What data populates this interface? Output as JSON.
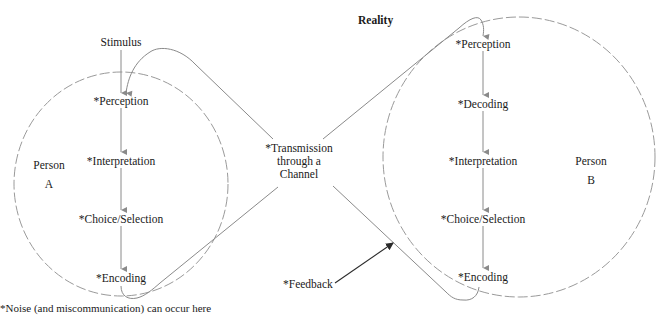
{
  "title": "Reality",
  "stimulus": "Stimulus",
  "person_a": {
    "label_line1": "Person",
    "label_line2": "A",
    "steps": [
      "*Perception",
      "*Interpretation",
      "*Choice/Selection",
      "*Encoding"
    ]
  },
  "person_b": {
    "label_line1": "Person",
    "label_line2": "B",
    "steps": [
      "*Perception",
      "*Decoding",
      "*Interpretation",
      "*Choice/Selection",
      "*Encoding"
    ]
  },
  "channel": {
    "line1": "*Transmission",
    "line2": "through a",
    "line3": "Channel"
  },
  "feedback": "*Feedback",
  "footnote": "*Noise (and miscommunication) can occur here",
  "colors": {
    "line": "#8a8a8a",
    "dashed_circle": "#9a9a9a",
    "text": "#1a1a1a",
    "feedback_arrow": "#2a2a2a"
  }
}
